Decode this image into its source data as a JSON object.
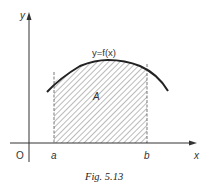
{
  "figure": {
    "caption": "Fig. 5.13",
    "axes": {
      "x_label": "x",
      "y_label": "y",
      "origin_label": "O"
    },
    "curve_label": "y=f(x)",
    "region_label": "A",
    "bounds": {
      "lower_label": "a",
      "upper_label": "b"
    },
    "colors": {
      "ink": "#333333",
      "hatch": "#666666",
      "background": "#ffffff"
    }
  }
}
